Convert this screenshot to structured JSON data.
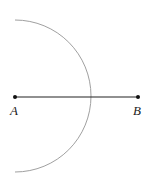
{
  "diagram": {
    "type": "geometric-construction",
    "points": [
      {
        "id": "A",
        "label": "A",
        "x": 15,
        "y": 97
      },
      {
        "id": "B",
        "label": "B",
        "x": 138,
        "y": 97
      }
    ],
    "segment": {
      "from": "A",
      "to": "B",
      "color": "#222222"
    },
    "arc": {
      "center": "A",
      "radius": 76,
      "color": "#999999",
      "start": [
        15,
        20
      ],
      "end": [
        15,
        172
      ]
    }
  }
}
